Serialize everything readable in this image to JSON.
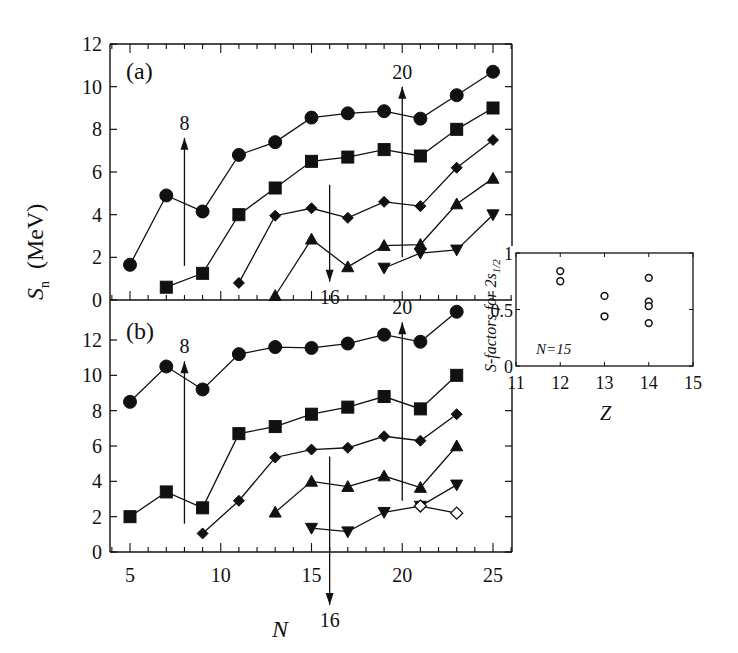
{
  "figure": {
    "ylabel_main": "S",
    "ylabel_sub": "n",
    "ylabel_unit": "(MeV)",
    "xlabel": "N",
    "panel_a_label": "(a)",
    "panel_b_label": "(b)",
    "inset_ylabel_main": "S-factors for 2s",
    "inset_ylabel_sub": "1/2",
    "inset_xlabel": "Z",
    "inset_annotation": "N=15"
  },
  "chart_data": [
    {
      "id": "panel_a",
      "type": "line",
      "title": "(a)",
      "xlabel": "N",
      "ylabel": "S_n (MeV)",
      "xlim": [
        4,
        26
      ],
      "ylim": [
        0,
        12
      ],
      "yticks": [
        0,
        2,
        4,
        6,
        8,
        10,
        12
      ],
      "xticks": [
        5,
        10,
        15,
        20,
        25
      ],
      "grid": false,
      "series": [
        {
          "name": "circles",
          "marker": "circle-filled",
          "x": [
            5,
            7,
            9,
            11,
            13,
            15,
            17,
            19,
            21,
            23,
            25
          ],
          "values": [
            1.65,
            4.9,
            4.15,
            6.8,
            7.4,
            8.55,
            8.75,
            8.85,
            8.5,
            9.6,
            10.7
          ]
        },
        {
          "name": "squares",
          "marker": "square-filled",
          "x": [
            7,
            9,
            11,
            13,
            15,
            17,
            19,
            21,
            23,
            25
          ],
          "values": [
            0.6,
            1.25,
            4.0,
            5.25,
            6.5,
            6.7,
            7.05,
            6.75,
            8.0,
            9.0
          ]
        },
        {
          "name": "diamonds",
          "marker": "diamond-filled",
          "x": [
            11,
            13,
            15,
            17,
            19,
            21,
            23,
            25
          ],
          "values": [
            0.8,
            3.95,
            4.3,
            3.85,
            4.6,
            4.4,
            6.2,
            7.5
          ]
        },
        {
          "name": "triangles-up",
          "marker": "triangle-up-filled",
          "x": [
            13,
            15,
            17,
            19,
            21,
            23,
            25
          ],
          "values": [
            0.2,
            2.85,
            1.55,
            2.55,
            2.6,
            4.5,
            5.7
          ]
        },
        {
          "name": "triangles-down",
          "marker": "triangle-down-filled",
          "x": [
            19,
            21,
            23,
            25
          ],
          "values": [
            1.5,
            2.2,
            2.35,
            4.0
          ]
        }
      ],
      "annotations": [
        {
          "text": "8",
          "x": 8,
          "direction": "up",
          "from": 1.6,
          "to": 7.6
        },
        {
          "text": "16",
          "x": 16,
          "direction": "down",
          "from": 5.4,
          "to": 0.85
        },
        {
          "text": "20",
          "x": 20,
          "direction": "up",
          "from": 2.0,
          "to": 10.0
        }
      ]
    },
    {
      "id": "panel_b",
      "type": "line",
      "title": "(b)",
      "xlabel": "N",
      "ylabel": "S_n (MeV)",
      "xlim": [
        4,
        26
      ],
      "ylim": [
        0,
        14
      ],
      "yticks": [
        0,
        2,
        4,
        6,
        8,
        10,
        12
      ],
      "xticks": [
        5,
        10,
        15,
        20,
        25
      ],
      "grid": false,
      "series": [
        {
          "name": "circles",
          "marker": "circle-filled",
          "x": [
            5,
            7,
            9,
            11,
            13,
            15,
            17,
            19,
            21,
            23
          ],
          "values": [
            8.5,
            10.5,
            9.2,
            11.2,
            11.6,
            11.55,
            11.8,
            12.3,
            11.9,
            13.6
          ]
        },
        {
          "name": "squares",
          "marker": "square-filled",
          "x": [
            5,
            7,
            9,
            11,
            13,
            15,
            17,
            19,
            21,
            23
          ],
          "values": [
            2.0,
            3.4,
            2.5,
            6.7,
            7.1,
            7.8,
            8.2,
            8.8,
            8.1,
            10.0
          ]
        },
        {
          "name": "diamonds",
          "marker": "diamond-filled",
          "x": [
            9,
            11,
            13,
            15,
            17,
            19,
            21,
            23
          ],
          "values": [
            1.05,
            2.9,
            5.35,
            5.8,
            5.9,
            6.55,
            6.3,
            7.8
          ]
        },
        {
          "name": "triangles-up",
          "marker": "triangle-up-filled",
          "x": [
            13,
            15,
            17,
            19,
            21,
            23
          ],
          "values": [
            2.25,
            4.0,
            3.7,
            4.3,
            3.65,
            6.0
          ]
        },
        {
          "name": "triangles-down",
          "marker": "triangle-down-filled",
          "x": [
            15,
            17,
            19,
            21,
            23
          ],
          "values": [
            1.35,
            1.15,
            2.25,
            2.6,
            3.8
          ]
        },
        {
          "name": "open-diamonds",
          "marker": "diamond-open",
          "x": [
            21,
            23
          ],
          "values": [
            2.6,
            2.2
          ]
        }
      ],
      "annotations": [
        {
          "text": "8",
          "x": 8,
          "direction": "up",
          "from": 1.6,
          "to": 10.8
        },
        {
          "text": "20",
          "x": 20,
          "direction": "up",
          "from": 2.9,
          "to": 13.0
        },
        {
          "text": "16",
          "x": 16,
          "direction": "down",
          "from": 5.4,
          "to": -3.0
        }
      ]
    },
    {
      "id": "inset",
      "type": "scatter",
      "title": "",
      "xlabel": "Z",
      "ylabel": "S-factors for 2s1/2",
      "xlim": [
        11,
        15
      ],
      "ylim": [
        0,
        1
      ],
      "xticks": [
        11,
        12,
        13,
        14,
        15
      ],
      "yticks": [
        0,
        0.5,
        1
      ],
      "ytick_labels": [
        "0",
        "0.5",
        "1"
      ],
      "annotation": "N=15",
      "grid": false,
      "series": [
        {
          "name": "S-factors",
          "marker": "circle-open",
          "x": [
            12,
            12,
            13,
            13,
            14,
            14,
            14,
            14
          ],
          "values": [
            0.84,
            0.75,
            0.62,
            0.44,
            0.78,
            0.57,
            0.53,
            0.38
          ]
        }
      ]
    }
  ]
}
